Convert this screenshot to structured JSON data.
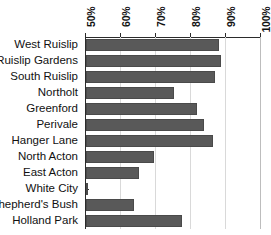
{
  "chart_data": {
    "type": "bar",
    "orientation": "horizontal",
    "title": "",
    "xlabel": "",
    "ylabel": "",
    "xlim": [
      50,
      100
    ],
    "ylim": null,
    "grid": true,
    "legend": false,
    "axis_position": "top",
    "tick_suffix": "%",
    "xticks": [
      50,
      60,
      70,
      80,
      90,
      100
    ],
    "xtick_labels": [
      "50%",
      "60%",
      "70%",
      "80%",
      "90%",
      "100%"
    ],
    "categories": [
      "West Ruislip",
      "Ruislip Gardens",
      "South Ruislip",
      "Northolt",
      "Greenford",
      "Perivale",
      "Hanger Lane",
      "North Acton",
      "East Acton",
      "White City",
      "Shepherd's Bush",
      "Holland Park"
    ],
    "values": [
      88.0,
      88.6,
      86.9,
      75.2,
      81.6,
      83.8,
      86.4,
      69.5,
      65.1,
      50.6,
      63.7,
      77.3
    ],
    "bar_color": "#595959",
    "grid_color": "#d9d9d9",
    "axis_color": "#2b2b2b"
  }
}
